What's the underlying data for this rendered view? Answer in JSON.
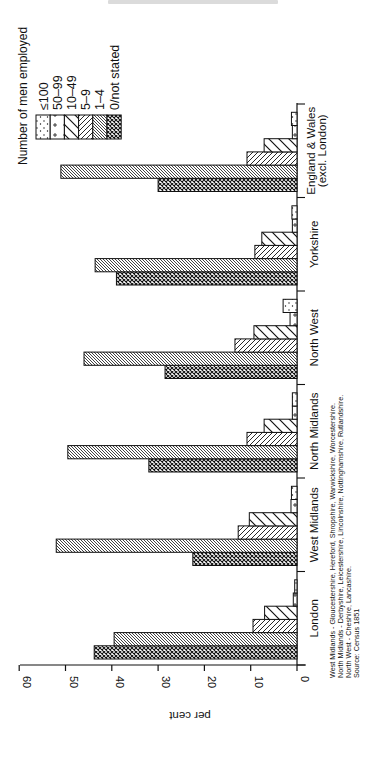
{
  "page": {
    "orientation": "rotated-90-ccw",
    "header_text_visible": false
  },
  "legend": {
    "title": "Number of men employed",
    "items": [
      {
        "label": "≤100",
        "pattern": "dots"
      },
      {
        "label": "50–99",
        "pattern": "plus"
      },
      {
        "label": "10–49",
        "pattern": "wide-backslash"
      },
      {
        "label": "5–9",
        "pattern": "slash"
      },
      {
        "label": "1–4",
        "pattern": "dense-backslash"
      },
      {
        "label": "0/not stated",
        "pattern": "crosshatch"
      }
    ]
  },
  "footnote": [
    "West Midlands - Gloucestershire, Hereford, Shropshire, Warwickshire, Worcestershire.",
    "North Midlands - Derbyshire, Leicestershire, Lincolnshire, Nottinghamshire, Rutlandshire.",
    "North West - Cheshire, Lancashire.",
    "Source: Census 1851"
  ],
  "colors": {
    "ink": "#111111",
    "background": "#ffffff"
  },
  "chart_data": {
    "type": "bar",
    "orientation": "vertical-bars (figure printed rotated 90° counter-clockwise)",
    "title": "",
    "xlabel": "",
    "ylabel": "per cent",
    "ylim": [
      0,
      60
    ],
    "yticks": [
      0,
      10,
      20,
      30,
      40,
      50,
      60
    ],
    "grid": false,
    "legend_title": "Number of men employed",
    "legend_position": "upper right (top-left in rotated page)",
    "categories": [
      "London",
      "West Midlands",
      "North Midlands",
      "North West",
      "Yorkshire",
      "England & Wales\n(excl. London)"
    ],
    "category_labels": [
      [
        "London"
      ],
      [
        "West Midlands"
      ],
      [
        "North Midlands"
      ],
      [
        "North West"
      ],
      [
        "Yorkshire"
      ],
      [
        "England & Wales",
        "(excl. London)"
      ]
    ],
    "series": [
      {
        "name": "0/not stated",
        "pattern": "crosshatch",
        "values": [
          43.8,
          22.5,
          32.0,
          28.5,
          39.0,
          30.0
        ]
      },
      {
        "name": "1–4",
        "pattern": "dense-backslash",
        "values": [
          39.5,
          52.0,
          49.5,
          46.0,
          43.6,
          51.0
        ]
      },
      {
        "name": "5–9",
        "pattern": "slash",
        "values": [
          9.5,
          12.7,
          10.8,
          13.4,
          9.1,
          10.8
        ]
      },
      {
        "name": "10–49",
        "pattern": "wide-backslash",
        "values": [
          7.0,
          10.3,
          7.1,
          9.3,
          7.6,
          7.1
        ]
      },
      {
        "name": "50–99",
        "pattern": "plus",
        "values": [
          0.8,
          1.3,
          1.0,
          1.5,
          1.0,
          1.0
        ]
      },
      {
        "name": "≤100",
        "pattern": "dots",
        "values": [
          0.5,
          1.2,
          1.0,
          3.0,
          1.1,
          1.2
        ]
      }
    ],
    "annotations": [
      "West Midlands - Gloucestershire, Hereford, Shropshire, Warwickshire, Worcestershire.",
      "North Midlands - Derbyshire, Leicestershire, Lincolnshire, Nottinghamshire, Rutlandshire.",
      "North West - Cheshire, Lancashire.",
      "Source: Census 1851"
    ]
  }
}
